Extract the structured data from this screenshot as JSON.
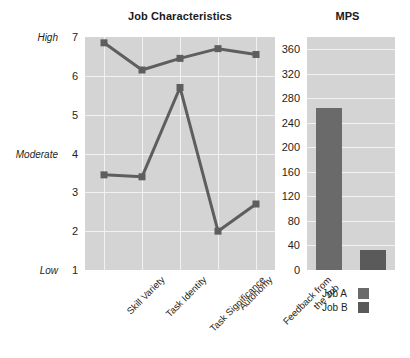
{
  "chart_data": [
    {
      "type": "line",
      "title": "Job Characteristics",
      "xlabel": "",
      "ylabel": "",
      "ylim": [
        1,
        7
      ],
      "yticks": [
        1,
        2,
        3,
        4,
        5,
        6,
        7
      ],
      "ytick_labels": [
        "1",
        "2",
        "3",
        "4",
        "5",
        "6",
        "7"
      ],
      "y_band_labels": [
        {
          "value": 7,
          "label": "High"
        },
        {
          "value": 4,
          "label": "Moderate"
        },
        {
          "value": 1,
          "label": "Low"
        }
      ],
      "categories": [
        "Skill Variety",
        "Task Identity",
        "Task Significance",
        "Autonomy",
        "Feedback from\nthe Job"
      ],
      "grid": true,
      "legend_position": "bottom-right",
      "series": [
        {
          "name": "Job A",
          "values": [
            6.85,
            6.15,
            6.45,
            6.7,
            6.55
          ],
          "color": "#5e5e5e"
        },
        {
          "name": "Job B",
          "values": [
            3.45,
            3.4,
            5.7,
            2.0,
            2.7
          ],
          "color": "#5e5e5e"
        }
      ]
    },
    {
      "type": "bar",
      "title": "MPS",
      "xlabel": "",
      "ylabel": "",
      "ylim": [
        0,
        380
      ],
      "yticks": [
        0,
        40,
        80,
        120,
        160,
        200,
        240,
        280,
        320,
        360
      ],
      "ytick_labels": [
        "0",
        "40",
        "80",
        "120",
        "160",
        "200",
        "240",
        "280",
        "320",
        "360"
      ],
      "categories": [
        "Job A",
        "Job B"
      ],
      "values": [
        265,
        33
      ],
      "grid": true,
      "colors": [
        "#6a6a6a",
        "#5a5a5a"
      ]
    }
  ],
  "titles": {
    "left": "Job Characteristics",
    "right": "MPS"
  },
  "legend": {
    "items": [
      {
        "label": "Job A",
        "color": "#6a6a6a"
      },
      {
        "label": "Job B",
        "color": "#5a5a5a"
      }
    ]
  },
  "colors": {
    "plot_background": "#d4d4d4",
    "gridline": "#f2f2f2",
    "line": "#5e5e5e",
    "bar_a": "#6a6a6a",
    "bar_b": "#5a5a5a",
    "text": "#231f20"
  }
}
